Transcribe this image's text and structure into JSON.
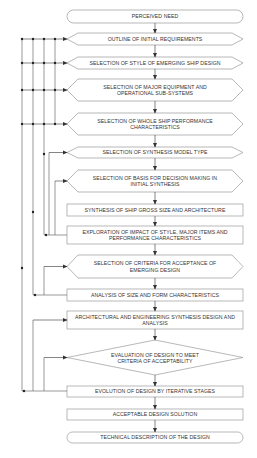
{
  "diagram": {
    "type": "flowchart",
    "colors": {
      "stroke": "#8a8a8a",
      "connector": "#333333",
      "text": "#333333",
      "background": "#ffffff"
    },
    "nodes": [
      {
        "id": "n1",
        "shape": "terminal",
        "label": "Perceived Need"
      },
      {
        "id": "n2",
        "shape": "hexagon",
        "label": "Outline of Initial Requirements"
      },
      {
        "id": "n3",
        "shape": "hexagon",
        "label": "Selection of Style of Emerging Ship Design"
      },
      {
        "id": "n4",
        "shape": "hexagon",
        "label": "Selection of Major Equipment and Operational Sub-systems"
      },
      {
        "id": "n5",
        "shape": "hexagon",
        "label": "Selection of Whole Ship Performance Characteristics"
      },
      {
        "id": "n6",
        "shape": "hexagon",
        "label": "Selection of Synthesis Model Type"
      },
      {
        "id": "n7",
        "shape": "hexagon",
        "label": "Selection of Basis for Decision Making in Initial Synthesis"
      },
      {
        "id": "n8",
        "shape": "rect",
        "label": "Synthesis of Ship Gross Size and Architecture"
      },
      {
        "id": "n9",
        "shape": "rect",
        "label": "Exploration of Impact of Style, Major Items and Performance Characteristics"
      },
      {
        "id": "n10",
        "shape": "hexagon",
        "label": "Selection of Criteria for Acceptance of Emerging Design"
      },
      {
        "id": "n11",
        "shape": "rect",
        "label": "Analysis of Size and Form Characteristics"
      },
      {
        "id": "n12",
        "shape": "rect",
        "label": "Architectural and Engineering Synthesis Design and Analysis"
      },
      {
        "id": "n13",
        "shape": "diamond",
        "label": "Evaluation of Design to Meet Criteria of Acceptability"
      },
      {
        "id": "n14",
        "shape": "rect",
        "label": "Evolution of Design by Iterative Stages"
      },
      {
        "id": "n15",
        "shape": "rect",
        "label": "Acceptable Design Solution"
      },
      {
        "id": "n16",
        "shape": "terminal",
        "label": "Technical Description of the Design"
      }
    ],
    "labels": {
      "n1": "Perceived Need",
      "n2": "Outline of Initial Requirements",
      "n3": "Selection of Style of Emerging Ship Design",
      "n4a": "Selection of Major Equipment and",
      "n4b": "Operational Sub-systems",
      "n5a": "Selection of Whole Ship Performance",
      "n5b": "Characteristics",
      "n6": "Selection of Synthesis Model Type",
      "n7a": "Selection of Basis for Decision Making in",
      "n7b": "Initial Synthesis",
      "n8": "Synthesis of Ship Gross Size and Architecture",
      "n9a": "Exploration of Impact of Style, Major Items and",
      "n9b": "Performance Characteristics",
      "n10a": "Selection of Criteria for Acceptance of",
      "n10b": "Emerging Design",
      "n11": "Analysis of Size and Form Characteristics",
      "n12a": "Architectural and Engineering Synthesis Design and",
      "n12b": "Analysis",
      "n13a": "Evaluation of Design to Meet",
      "n13b": "Criteria of Acceptability",
      "n14": "Evolution of Design by Iterative Stages",
      "n15": "Acceptable Design Solution",
      "n16": "Technical Description of the Design"
    },
    "edges": [
      [
        "n1",
        "n2"
      ],
      [
        "n2",
        "n3"
      ],
      [
        "n3",
        "n4"
      ],
      [
        "n4",
        "n5"
      ],
      [
        "n5",
        "n6"
      ],
      [
        "n6",
        "n7"
      ],
      [
        "n7",
        "n8"
      ],
      [
        "n8",
        "n9"
      ],
      [
        "n9",
        "n10"
      ],
      [
        "n10",
        "n11"
      ],
      [
        "n11",
        "n12"
      ],
      [
        "n12",
        "n13"
      ],
      [
        "n13",
        "n14"
      ],
      [
        "n14",
        "n15"
      ],
      [
        "n15",
        "n16"
      ]
    ],
    "feedback_loops": [
      {
        "from": "n9",
        "to": [
          "n2",
          "n3",
          "n4",
          "n5",
          "n6",
          "n7"
        ]
      },
      {
        "from": "n11",
        "to": [
          "n2",
          "n3",
          "n4",
          "n5",
          "n10"
        ]
      },
      {
        "from": "n14",
        "to": [
          "n2",
          "n3",
          "n4",
          "n5",
          "n12",
          "n13"
        ]
      }
    ]
  }
}
